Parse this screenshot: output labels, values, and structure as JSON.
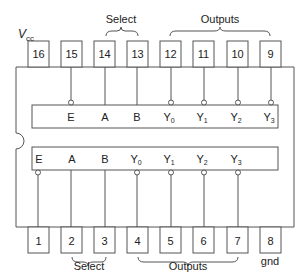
{
  "diagram": {
    "type": "ic-pinout",
    "package": "16-pin DIP",
    "vcc_label": "V",
    "vcc_sub": "cc",
    "gnd_label": "gnd",
    "top_pins": [
      {
        "num": "16",
        "x": 38
      },
      {
        "num": "15",
        "x": 71
      },
      {
        "num": "14",
        "x": 105
      },
      {
        "num": "13",
        "x": 137
      },
      {
        "num": "12",
        "x": 171
      },
      {
        "num": "11",
        "x": 204
      },
      {
        "num": "10",
        "x": 237
      },
      {
        "num": "9",
        "x": 270
      }
    ],
    "bottom_pins": [
      {
        "num": "1",
        "x": 38
      },
      {
        "num": "2",
        "x": 71
      },
      {
        "num": "3",
        "x": 105
      },
      {
        "num": "4",
        "x": 137
      },
      {
        "num": "5",
        "x": 171
      },
      {
        "num": "6",
        "x": 204
      },
      {
        "num": "7",
        "x": 237
      },
      {
        "num": "8",
        "x": 270
      }
    ],
    "top_group_labels": {
      "select": "Select",
      "outputs": "Outputs"
    },
    "bottom_group_labels": {
      "select": "Select",
      "outputs": "Outputs"
    },
    "top_decoder": {
      "signals": [
        {
          "main": "E",
          "sub": "",
          "pin": "15",
          "inverted": true
        },
        {
          "main": "A",
          "sub": "",
          "pin": "14",
          "inverted": false
        },
        {
          "main": "B",
          "sub": "",
          "pin": "13",
          "inverted": false
        },
        {
          "main": "Y",
          "sub": "0",
          "pin": "12",
          "inverted": true
        },
        {
          "main": "Y",
          "sub": "1",
          "pin": "11",
          "inverted": true
        },
        {
          "main": "Y",
          "sub": "2",
          "pin": "10",
          "inverted": true
        },
        {
          "main": "Y",
          "sub": "3",
          "pin": "9",
          "inverted": true
        }
      ]
    },
    "bottom_decoder": {
      "signals": [
        {
          "main": "E",
          "sub": "",
          "pin": "1",
          "inverted": true
        },
        {
          "main": "A",
          "sub": "",
          "pin": "2",
          "inverted": false
        },
        {
          "main": "B",
          "sub": "",
          "pin": "3",
          "inverted": false
        },
        {
          "main": "Y",
          "sub": "0",
          "pin": "4",
          "inverted": true
        },
        {
          "main": "Y",
          "sub": "1",
          "pin": "5",
          "inverted": true
        },
        {
          "main": "Y",
          "sub": "2",
          "pin": "6",
          "inverted": true
        },
        {
          "main": "Y",
          "sub": "3",
          "pin": "7",
          "inverted": true
        }
      ]
    },
    "colors": {
      "stroke": "#555555",
      "text": "#222222",
      "background": "#ffffff"
    }
  }
}
